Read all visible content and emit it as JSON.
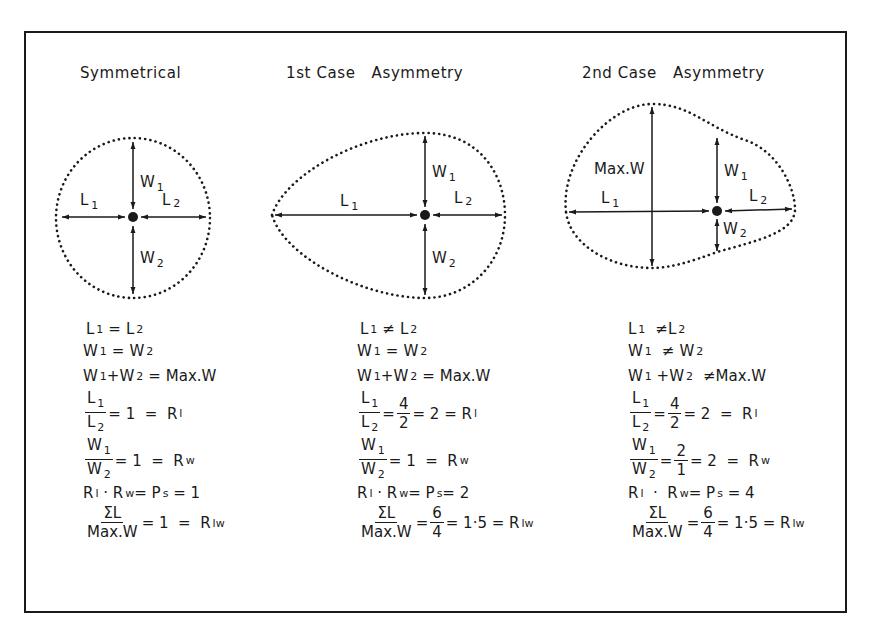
{
  "panels": [
    {
      "title": "Symmetrical",
      "shape_labels": {
        "w1": "W",
        "w1_sub": "1",
        "w2": "W",
        "w2_sub": "2",
        "l1": "L",
        "l1_sub": "1",
        "l2": "L",
        "l2_sub": "2"
      },
      "formulas": {
        "r1": {
          "a": "L",
          "a_sub": "1",
          "op": "=",
          "b": "L",
          "b_sub": "2"
        },
        "r2": {
          "a": "W",
          "a_sub": "1",
          "op": "=",
          "b": "W",
          "b_sub": "2"
        },
        "r3": {
          "a": "W",
          "a_sub": "1",
          "plus": "+W",
          "plus_sub": "2",
          "op": "=",
          "b": "Max.W"
        },
        "r4": {
          "num": "L",
          "num_sub": "1",
          "den": "L",
          "den_sub": "2",
          "rest": "= 1  =  R",
          "rest_sub": "l"
        },
        "r5": {
          "num": "W",
          "num_sub": "1",
          "den": "W",
          "den_sub": "2",
          "rest": "= 1  =  R",
          "rest_sub": "w"
        },
        "r6": {
          "a": "R",
          "a_sub": "l",
          "mid": " · R",
          "mid_sub": "w",
          "eq": "= P",
          "eq_sub": "s",
          "rest": " = 1"
        },
        "r7": {
          "num": "ΣL",
          "den": "Max.W",
          "rest": "= 1  =  R",
          "rest_sub": "lw"
        }
      }
    },
    {
      "title": "1st Case   Asymmetry",
      "shape_labels": {
        "w1": "W",
        "w1_sub": "1",
        "w2": "W",
        "w2_sub": "2",
        "l1": "L",
        "l1_sub": "1",
        "l2": "L",
        "l2_sub": "2"
      },
      "formulas": {
        "r1": {
          "a": "L",
          "a_sub": "1",
          "op": "≠",
          "b": "L",
          "b_sub": "2"
        },
        "r2": {
          "a": "W",
          "a_sub": "1",
          "op": "=",
          "b": "W",
          "b_sub": "2"
        },
        "r3": {
          "a": "W",
          "a_sub": "1",
          "plus": "+W",
          "plus_sub": "2",
          "op": "=",
          "b": "Max.W"
        },
        "r4": {
          "num": "L",
          "num_sub": "1",
          "den": "L",
          "den_sub": "2",
          "f2_num": "4",
          "f2_den": "2",
          "rest": "= 2 = R",
          "rest_sub": "l"
        },
        "r5": {
          "num": "W",
          "num_sub": "1",
          "den": "W",
          "den_sub": "2",
          "rest": "= 1  =  R",
          "rest_sub": "w"
        },
        "r6": {
          "a": "R",
          "a_sub": "l",
          "mid": " · R",
          "mid_sub": "w",
          "eq": "= P",
          "eq_sub": "s",
          "rest": "= 2"
        },
        "r7": {
          "num": "ΣL",
          "den": "Max.W",
          "f2_num": "6",
          "f2_den": "4",
          "rest": "= 1·5 = R",
          "rest_sub": "lw"
        }
      }
    },
    {
      "title": "2nd Case   Asymmetry",
      "shape_labels": {
        "maxw": "Max.W",
        "w1": "W",
        "w1_sub": "1",
        "w2": "W",
        "w2_sub": "2",
        "l1": "L",
        "l1_sub": "1",
        "l2": "L",
        "l2_sub": "2"
      },
      "formulas": {
        "r1": {
          "a": "L",
          "a_sub": "1",
          "op": "≠",
          "b": "L",
          "b_sub": "2"
        },
        "r2": {
          "a": "W",
          "a_sub": "1",
          "op": "≠",
          "b": "W",
          "b_sub": "2"
        },
        "r3": {
          "a": "W",
          "a_sub": "1",
          "plus": " +W",
          "plus_sub": "2",
          "op": "≠",
          "b": "Max.W"
        },
        "r4": {
          "num": "L",
          "num_sub": "1",
          "den": "L",
          "den_sub": "2",
          "f2_num": "4",
          "f2_den": "2",
          "rest": "= 2  =  R",
          "rest_sub": "l"
        },
        "r5": {
          "num": "W",
          "num_sub": "1",
          "den": "W",
          "den_sub": "2",
          "f2_num": "2",
          "f2_den": "1",
          "rest": "= 2  =  R",
          "rest_sub": "w"
        },
        "r6": {
          "a": "R",
          "a_sub": "l",
          "mid": "  ·  R",
          "mid_sub": "w",
          "eq": "= P",
          "eq_sub": "s",
          "rest": " = 4"
        },
        "r7": {
          "num": "ΣL",
          "den": "Max.W",
          "f2_num": "6",
          "f2_den": "4",
          "rest": "= 1·5 = R",
          "rest_sub": "lw"
        }
      }
    }
  ],
  "colors": {
    "ink": "#1a1a1a",
    "background": "#ffffff"
  }
}
